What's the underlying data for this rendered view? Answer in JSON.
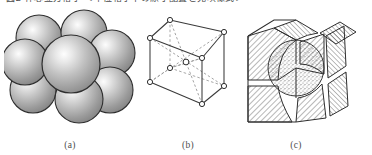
{
  "figure": {
    "top_clipped_text": "図2  体心立方格子 ＜単位格子中の原子配置と充填様式＞",
    "top_clipped_text_visible_fragment": "⊔  ⊓⊓⊓ ⌐⊓⌐⌐ ⌐⌐⌐⌐⌐  ⊜ ⌐⌐⌐⌐ ⌐⌐⌐⌐⌐⌐⌐⌐⌐⌐⌐ ⌐ ⌐ ⌐",
    "background_color": "#ffffff",
    "ink_color": "#3a3a3a"
  },
  "panels": [
    {
      "id": "a",
      "caption": "(a)",
      "name": "hard-sphere-model",
      "description": "Hard-sphere unit cell model of a body-centred cubic structure: eight corner spheres surrounding one larger central sphere, all touching along the body diagonal.",
      "sphere_count": 9,
      "sphere_fill_light": "#f2f2f2",
      "sphere_fill_mid": "#b4b4b4",
      "sphere_fill_dark": "#8a8a8a",
      "outline_color": "#2e2e2e",
      "spheres": [
        {
          "name": "corner-sphere-back-top-left",
          "cx": 35,
          "cy": 32,
          "r": 23,
          "layer": 1
        },
        {
          "name": "corner-sphere-back-top-right",
          "cx": 80,
          "cy": 27,
          "r": 23,
          "layer": 1
        },
        {
          "name": "corner-sphere-front-top-right",
          "cx": 108,
          "cy": 47,
          "r": 23,
          "layer": 1
        },
        {
          "name": "corner-sphere-back-bottom-left",
          "cx": 29,
          "cy": 84,
          "r": 23,
          "layer": 1
        },
        {
          "name": "corner-sphere-back-bottom-right",
          "cx": 105,
          "cy": 86,
          "r": 23,
          "layer": 1
        },
        {
          "name": "corner-sphere-front-bottom-right",
          "cx": 113,
          "cy": 74,
          "r": 21,
          "layer": 1
        },
        {
          "name": "corner-sphere-front-top-left",
          "cx": 22,
          "cy": 55,
          "r": 23,
          "layer": 2
        },
        {
          "name": "corner-sphere-front-bottom-left",
          "cx": 72,
          "cy": 93,
          "r": 25,
          "layer": 2
        },
        {
          "name": "centre-sphere",
          "cx": 68,
          "cy": 56,
          "r": 29,
          "layer": 3
        }
      ]
    },
    {
      "id": "b",
      "caption": "(b)",
      "name": "reduced-sphere-unit-cell",
      "description": "Reduced-sphere (lattice point) representation of the body-centred cubic unit cell: open circles at the eight cube corners plus one at the body centre, joined to the corners by dashed body diagonals.",
      "lattice_point_count": 9,
      "edge_color": "#3a3a3a",
      "dashed_color": "#8c8c8c",
      "node_fill": "#ffffff",
      "node_radius": 2.6,
      "vertices": [
        {
          "name": "corner-front-bottom-left",
          "x": 10,
          "y": 76
        },
        {
          "name": "corner-front-bottom-right",
          "x": 62,
          "y": 98
        },
        {
          "name": "corner-front-top-right",
          "x": 62,
          "y": 52
        },
        {
          "name": "corner-front-top-left",
          "x": 10,
          "y": 32
        },
        {
          "name": "corner-back-bottom-left",
          "x": 30,
          "y": 62
        },
        {
          "name": "corner-back-bottom-right",
          "x": 84,
          "y": 80
        },
        {
          "name": "corner-back-top-right",
          "x": 84,
          "y": 26
        },
        {
          "name": "corner-back-top-left",
          "x": 30,
          "y": 14
        },
        {
          "name": "body-centre",
          "x": 46,
          "y": 56
        }
      ]
    },
    {
      "id": "c",
      "caption": "(c)",
      "name": "cut-away-aggregate-model",
      "description": "Cut-away aggregate of many body-centred cubic cells: hatched cube octants surround a stippled central sphere, showing how the unit cells pack together in a larger crystal.",
      "hatch_color": "#4a4a4a",
      "hatch_angle_degrees": 45,
      "stipple_color": "#8f8f8f",
      "outline_color": "#2e2e2e",
      "centre_sphere": {
        "name": "stippled-centre-sphere",
        "cx": 62,
        "cy": 62,
        "r": 28
      }
    }
  ]
}
